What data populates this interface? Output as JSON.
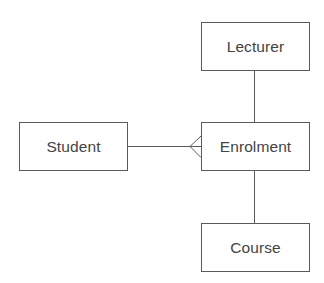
{
  "diagram": {
    "type": "entity-relationship",
    "notation": "crow's foot",
    "colors": {
      "line": "#5a5a5a",
      "text": "#444444",
      "background": "#ffffff"
    },
    "entities": [
      {
        "id": "lecturer",
        "label": "Lecturer"
      },
      {
        "id": "student",
        "label": "Student"
      },
      {
        "id": "enrolment",
        "label": "Enrolment"
      },
      {
        "id": "course",
        "label": "Course"
      }
    ],
    "relationships": [
      {
        "from": "student",
        "to": "enrolment",
        "from_end": "one",
        "to_end": "many (crow's foot)"
      },
      {
        "from": "lecturer",
        "to": "enrolment",
        "from_end": "plain",
        "to_end": "plain"
      },
      {
        "from": "enrolment",
        "to": "course",
        "from_end": "plain",
        "to_end": "plain"
      }
    ]
  }
}
